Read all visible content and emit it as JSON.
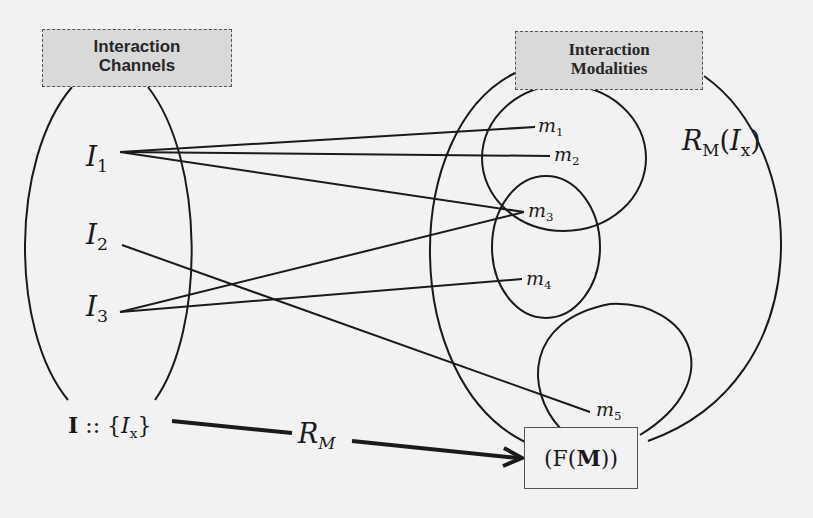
{
  "headers": {
    "channels": {
      "line1": "Interaction",
      "line2": "Channels"
    },
    "modalities": {
      "line1": "Interaction",
      "line2": "Modalities"
    }
  },
  "channels": [
    {
      "id": "I1",
      "base": "I",
      "sub": "1"
    },
    {
      "id": "I2",
      "base": "I",
      "sub": "2"
    },
    {
      "id": "I3",
      "base": "I",
      "sub": "3"
    }
  ],
  "modalities": [
    {
      "id": "m1",
      "base": "m",
      "sub": "1"
    },
    {
      "id": "m2",
      "base": "m",
      "sub": "2"
    },
    {
      "id": "m3",
      "base": "m",
      "sub": "3"
    },
    {
      "id": "m4",
      "base": "m",
      "sub": "4"
    },
    {
      "id": "m5",
      "base": "m",
      "sub": "5"
    }
  ],
  "connections": [
    {
      "from": "I1",
      "to": "m1"
    },
    {
      "from": "I1",
      "to": "m2"
    },
    {
      "from": "I1",
      "to": "m3"
    },
    {
      "from": "I2",
      "to": "m5"
    },
    {
      "from": "I3",
      "to": "m3"
    },
    {
      "from": "I3",
      "to": "m4"
    }
  ],
  "set_label": {
    "bold": "I",
    "op": " :: ",
    "open": "{",
    "base": "I",
    "sub": "x",
    "close": "}"
  },
  "relation_label": {
    "base": "R",
    "sub": "M"
  },
  "relation_set_label": {
    "base": "R",
    "sub": "M",
    "arg_open": "(",
    "arg_base": "I",
    "arg_sub": "x",
    "arg_close": ")"
  },
  "function_box": {
    "open": "(",
    "text": "F(",
    "bold": "M",
    "close": "))"
  },
  "colors": {
    "background": "#f2f2f2",
    "stroke": "#1a1a1a",
    "header_fill": "#d9d9d9",
    "header_border": "#555555"
  }
}
